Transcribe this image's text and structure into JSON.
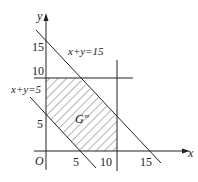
{
  "diagram": {
    "type": "linear-programming-feasible-region",
    "axes": {
      "x_label": "x",
      "y_label": "y",
      "origin_label": "O",
      "x_ticks": [
        "5",
        "10",
        "15"
      ],
      "y_ticks": [
        "5",
        "10",
        "15"
      ]
    },
    "lines": {
      "upper": "x+y=15",
      "lower": "x+y=5"
    },
    "region_label": "G″",
    "colors": {
      "ink": "#222222",
      "background": "#ffffff"
    }
  }
}
